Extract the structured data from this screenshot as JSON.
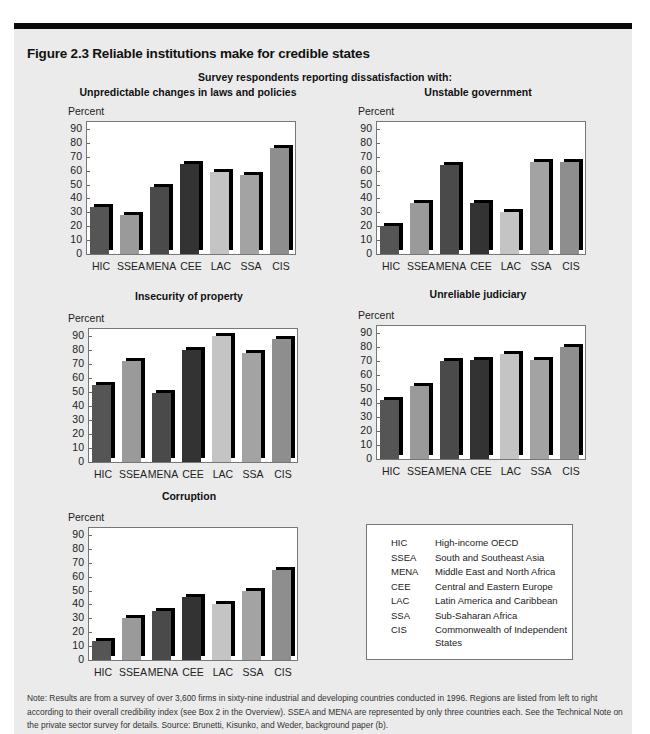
{
  "figure": {
    "title": "Figure 2.3  Reliable institutions make for credible states",
    "subtitle": "Survey respondents reporting dissatisfaction with:",
    "note": "Note: Results are from a survey of over 3,600 firms in sixty-nine industrial and developing countries conducted in 1996. Regions are listed from left to right according to their overall credibility index (see Box 2 in the Overview). SSEA and MENA are represented by only three countries each. See the Technical Note on the private sector survey for details. Source: Brunetti, Kisunko, and Weder, background paper (b)."
  },
  "colors": {
    "HIC": "#555555",
    "SSEA": "#9a9a9a",
    "MENA": "#4a4a4a",
    "CEE": "#333333",
    "LAC": "#c4c4c4",
    "SSA": "#a3a3a3",
    "CIS": "#8e8e8e",
    "shadow": "#000000",
    "plot_bg": "#ffffff",
    "page_bg": "#ebebeb"
  },
  "legend": {
    "items": [
      {
        "abbr": "HIC",
        "name": "High-income OECD"
      },
      {
        "abbr": "SSEA",
        "name": "South and Southeast Asia"
      },
      {
        "abbr": "MENA",
        "name": "Middle East and North Africa"
      },
      {
        "abbr": "CEE",
        "name": "Central and Eastern Europe"
      },
      {
        "abbr": "LAC",
        "name": "Latin America and Caribbean"
      },
      {
        "abbr": "SSA",
        "name": "Sub-Saharan Africa"
      },
      {
        "abbr": "CIS",
        "name": "Commonwealth of Independent States"
      }
    ]
  },
  "chart_data": [
    {
      "type": "bar",
      "title": "Unpredictable changes in laws and policies",
      "xlabel": "",
      "ylabel": "Percent",
      "ylim": [
        0,
        90
      ],
      "yticks": [
        0,
        10,
        20,
        30,
        40,
        50,
        60,
        70,
        80,
        90
      ],
      "grid": false,
      "categories": [
        "HIC",
        "SSEA",
        "MENA",
        "CEE",
        "LAC",
        "SSA",
        "CIS"
      ],
      "values": [
        34,
        28,
        48,
        65,
        59,
        57,
        76
      ]
    },
    {
      "type": "bar",
      "title": "Unstable government",
      "xlabel": "",
      "ylabel": "Percent",
      "ylim": [
        0,
        90
      ],
      "yticks": [
        0,
        10,
        20,
        30,
        40,
        50,
        60,
        70,
        80,
        90
      ],
      "grid": false,
      "categories": [
        "HIC",
        "SSEA",
        "MENA",
        "CEE",
        "LAC",
        "SSA",
        "CIS"
      ],
      "values": [
        20,
        37,
        64,
        37,
        30,
        66,
        66
      ]
    },
    {
      "type": "bar",
      "title": "Insecurity of property",
      "xlabel": "",
      "ylabel": "Percent",
      "ylim": [
        0,
        90
      ],
      "yticks": [
        0,
        10,
        20,
        30,
        40,
        50,
        60,
        70,
        80,
        90
      ],
      "grid": false,
      "categories": [
        "HIC",
        "SSEA",
        "MENA",
        "CEE",
        "LAC",
        "SSA",
        "CIS"
      ],
      "values": [
        55,
        72,
        49,
        80,
        90,
        78,
        88
      ]
    },
    {
      "type": "bar",
      "title": "Unreliable judiciary",
      "xlabel": "",
      "ylabel": "Percent",
      "ylim": [
        0,
        90
      ],
      "yticks": [
        0,
        10,
        20,
        30,
        40,
        50,
        60,
        70,
        80,
        90
      ],
      "grid": false,
      "categories": [
        "HIC",
        "SSEA",
        "MENA",
        "CEE",
        "LAC",
        "SSA",
        "CIS"
      ],
      "values": [
        42,
        52,
        70,
        71,
        75,
        71,
        80
      ]
    },
    {
      "type": "bar",
      "title": "Corruption",
      "xlabel": "",
      "ylabel": "Percent",
      "ylim": [
        0,
        90
      ],
      "yticks": [
        0,
        10,
        20,
        30,
        40,
        50,
        60,
        70,
        80,
        90
      ],
      "grid": false,
      "categories": [
        "HIC",
        "SSEA",
        "MENA",
        "CEE",
        "LAC",
        "SSA",
        "CIS"
      ],
      "values": [
        14,
        30,
        35,
        45,
        40,
        50,
        65
      ]
    }
  ]
}
